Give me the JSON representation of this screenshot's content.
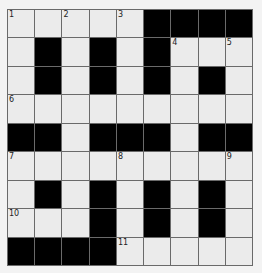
{
  "puzzle": {
    "rows": 9,
    "cols": 9,
    "grid": [
      "WWWWWBBBB",
      "WBWBWBWWW",
      "WBWBWBWBW",
      "WWWWWWWWW",
      "BBWBBBWBB",
      "WWWWWWWWW",
      "WBWBWBWBW",
      "WWWBWBWBW",
      "BBBBWWWWW"
    ],
    "numbers": [
      {
        "row": 0,
        "col": 0,
        "label": "1"
      },
      {
        "row": 0,
        "col": 2,
        "label": "2"
      },
      {
        "row": 0,
        "col": 4,
        "label": "3"
      },
      {
        "row": 1,
        "col": 6,
        "label": "4"
      },
      {
        "row": 1,
        "col": 8,
        "label": "5"
      },
      {
        "row": 3,
        "col": 0,
        "label": "6"
      },
      {
        "row": 5,
        "col": 0,
        "label": "7"
      },
      {
        "row": 5,
        "col": 4,
        "label": "8"
      },
      {
        "row": 5,
        "col": 8,
        "label": "9"
      },
      {
        "row": 7,
        "col": 0,
        "label": "10"
      },
      {
        "row": 8,
        "col": 4,
        "label": "11"
      }
    ],
    "colors": {
      "block": "#000000",
      "open": "#ebebeb",
      "gridline": "#6a6a6a",
      "background": "#f3f3f3"
    }
  }
}
